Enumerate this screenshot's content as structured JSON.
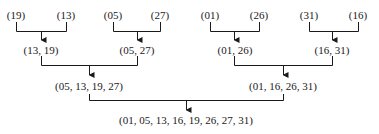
{
  "diagram": {
    "type": "merge-sort-tree",
    "level1": [
      "(19)",
      "(13)",
      "(05)",
      "(27)",
      "(01)",
      "(26)",
      "(31)",
      "(16)"
    ],
    "level2": [
      "(13, 19)",
      "(05, 27)",
      "(01, 26)",
      "(16, 31)"
    ],
    "level3": [
      "(05, 13, 19, 27)",
      "(01, 16, 26, 31)"
    ],
    "level4": [
      "(01, 05, 13, 16, 19, 26, 27, 31)"
    ]
  }
}
